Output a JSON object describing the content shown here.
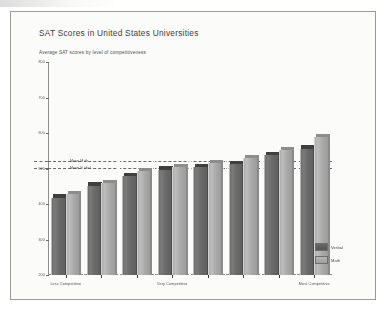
{
  "page": {
    "background": "#fbfbf9",
    "border_color": "#9a9a96"
  },
  "chart_data": {
    "type": "bar",
    "title": "SAT Scores in United States Universities",
    "subtitle": "Average SAT scores by level of competitiveness",
    "xlabel": "",
    "ylabel": "",
    "ylim": [
      200,
      800
    ],
    "grid": false,
    "legend_position": "bottom-right",
    "orientation": "vertical-grouped-3d",
    "categories": [
      "Less Competitive",
      "",
      "",
      "Very Competitive",
      "",
      "",
      "",
      "Most Competitive"
    ],
    "tick_labels_y": [
      "800",
      "700",
      "600",
      "500",
      "400",
      "300",
      "200"
    ],
    "tick_values_y": [
      800,
      700,
      600,
      500,
      400,
      300,
      200
    ],
    "series": [
      {
        "name": "Verbal",
        "color": "#6a6a6a",
        "values": [
          418,
          452,
          479,
          497,
          505,
          512,
          538,
          556
        ]
      },
      {
        "name": "Math",
        "color": "#adadad",
        "values": [
          429,
          460,
          492,
          503,
          515,
          530,
          551,
          588
        ]
      }
    ],
    "reference_lines": [
      {
        "label": "Mean Math",
        "value": 521
      },
      {
        "label": "Mean Verbal",
        "value": 502
      }
    ],
    "legend": [
      {
        "label": "Verbal",
        "swatch": "verbal"
      },
      {
        "label": "Math",
        "swatch": "math"
      }
    ]
  }
}
